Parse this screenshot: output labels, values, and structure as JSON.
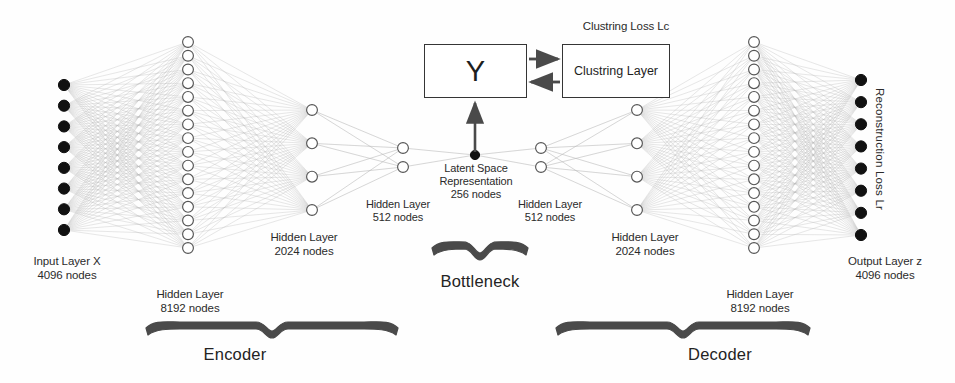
{
  "diagram": {
    "colors": {
      "node_filled": "#111111",
      "node_outline": "#555555",
      "edge": "#b9b9b9",
      "brace": "#4a4a4a",
      "text": "#2b2b2b",
      "box_border": "#353535",
      "arrow": "#4a4a4a"
    }
  },
  "clustering": {
    "loss_label": "Clustring Loss Lc",
    "y_box_label": "Y",
    "cluster_box_label": "Clustring Layer"
  },
  "reconstruction": {
    "loss_label": "Reconstruction Loss Lr"
  },
  "layers": {
    "input": {
      "label": "Input Layer X\n4096 nodes",
      "name": "Input Layer X",
      "nodes": "4096 nodes",
      "drawn_nodes": 8,
      "x": 64,
      "filled": true
    },
    "h8192_enc": {
      "label": "Hidden Layer\n8192 nodes",
      "name": "Hidden Layer",
      "nodes": "8192 nodes",
      "drawn_nodes": 16,
      "x": 188,
      "filled": false
    },
    "h2024_enc": {
      "label": "Hidden Layer\n2024 nodes",
      "name": "Hidden Layer",
      "nodes": "2024 nodes",
      "drawn_nodes": 4,
      "x": 312,
      "filled": false
    },
    "h512_enc": {
      "label": "Hidden Layer\n512 nodes",
      "name": "Hidden Layer",
      "nodes": "512 nodes",
      "drawn_nodes": 2,
      "x": 403,
      "filled": false
    },
    "latent": {
      "label": "Latent Space\nRepresentation\n256 nodes",
      "name": "Latent Space Representation",
      "nodes": "256 nodes",
      "drawn_nodes": 1,
      "x": 475,
      "filled": true
    },
    "h512_dec": {
      "label": "Hidden Layer\n512 nodes",
      "name": "Hidden Layer",
      "nodes": "512 nodes",
      "drawn_nodes": 2,
      "x": 541,
      "filled": false
    },
    "h2024_dec": {
      "label": "Hidden Layer\n2024 nodes",
      "name": "Hidden Layer",
      "nodes": "2024 nodes",
      "drawn_nodes": 4,
      "x": 637,
      "filled": false
    },
    "h8192_dec": {
      "label": "Hidden Layer\n8192 nodes",
      "name": "Hidden Layer",
      "nodes": "8192 nodes",
      "drawn_nodes": 16,
      "x": 754,
      "filled": false
    },
    "output": {
      "label": "Output Layer z\n4096 nodes",
      "name": "Output Layer z",
      "nodes": "4096 nodes",
      "drawn_nodes": 8,
      "x": 861,
      "filled": true
    }
  },
  "braces": {
    "encoder": "Encoder",
    "bottleneck": "Bottleneck",
    "decoder": "Decoder"
  },
  "chart_data": {
    "type": "diagram",
    "architecture": "autoencoder with clustering layer",
    "layer_sizes": [
      4096,
      8192,
      2024,
      512,
      256,
      512,
      2024,
      8192,
      4096
    ],
    "layer_names": [
      "Input Layer X",
      "Hidden Layer",
      "Hidden Layer",
      "Hidden Layer",
      "Latent Space Representation",
      "Hidden Layer",
      "Hidden Layer",
      "Hidden Layer",
      "Output Layer z"
    ],
    "sections": [
      "Encoder",
      "Bottleneck",
      "Decoder"
    ],
    "losses": [
      "Clustring Loss Lc",
      "Reconstruction Loss Lr"
    ],
    "auxiliary_blocks": [
      "Y",
      "Clustring Layer"
    ]
  }
}
